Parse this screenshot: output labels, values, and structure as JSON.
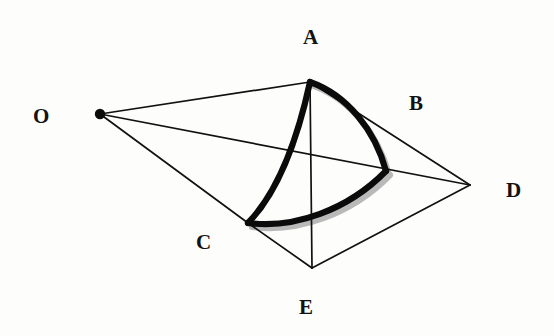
{
  "figure": {
    "background_color": "#fdfdfb",
    "ink_color": "#111111",
    "shadow_color": "#b9b9b9",
    "width": 554,
    "height": 336
  },
  "labels": {
    "o": "O",
    "a": "A",
    "b": "B",
    "c": "C",
    "d": "D",
    "e": "E"
  },
  "points": {
    "O": {
      "name": "O",
      "x": 100,
      "y": 114,
      "label_x": 33,
      "label_y": 106,
      "has_dot": true
    },
    "A": {
      "name": "A",
      "x": 310,
      "y": 82,
      "label_x": 303,
      "label_y": 27,
      "has_dot": false
    },
    "B": {
      "name": "B",
      "x": 386,
      "y": 171,
      "label_x": 409,
      "label_y": 93,
      "has_dot": false
    },
    "C": {
      "name": "C",
      "x": 248,
      "y": 223,
      "label_x": 196,
      "label_y": 232,
      "has_dot": false
    },
    "D": {
      "name": "D",
      "x": 470,
      "y": 185,
      "label_x": 506,
      "label_y": 180,
      "has_dot": false
    },
    "E": {
      "name": "E",
      "x": 312,
      "y": 268,
      "label_x": 299,
      "label_y": 297,
      "has_dot": false
    }
  },
  "thin_edges": [
    {
      "id": "edge-o-a",
      "from": "O",
      "to": "A",
      "path": "M 100 114 L 310 82"
    },
    {
      "id": "edge-o-d",
      "from": "O",
      "to": "D",
      "path": "M 100 114 L 470 185"
    },
    {
      "id": "edge-o-c",
      "from": "O",
      "to": "C",
      "path": "M 100 114 L 248 223"
    },
    {
      "id": "edge-a-e",
      "from": "A",
      "to": "E",
      "path": "M 310 82 L 312 268"
    },
    {
      "id": "edge-a-d",
      "from": "A",
      "to": "D",
      "path": "M 310 82 L 470 185"
    },
    {
      "id": "edge-c-e",
      "from": "C",
      "to": "E",
      "path": "M 248 223 L 312 268"
    },
    {
      "id": "edge-e-d",
      "from": "E",
      "to": "D",
      "path": "M 312 268 L 470 185"
    }
  ],
  "thick_arcs": [
    {
      "id": "arc-a-c",
      "from": "A",
      "to": "C",
      "curvature": "concave-right",
      "path": "M 310 82 C 300 128, 282 188, 248 223"
    },
    {
      "id": "arc-a-b",
      "from": "A",
      "to": "B",
      "curvature": "convex-upper-right",
      "path": "M 310 82 C 347 95, 375 130, 386 171"
    },
    {
      "id": "arc-c-b",
      "from": "C",
      "to": "B",
      "curvature": "convex-down",
      "path": "M 248 223 C 294 229, 348 210, 386 171"
    }
  ],
  "shadow_arcs": [
    {
      "id": "shadow-a-b",
      "path": "M 314 86 C 350 99, 378 134, 389 175"
    },
    {
      "id": "shadow-c-b",
      "path": "M 252 227 C 298 233, 352 214, 390 175"
    }
  ]
}
